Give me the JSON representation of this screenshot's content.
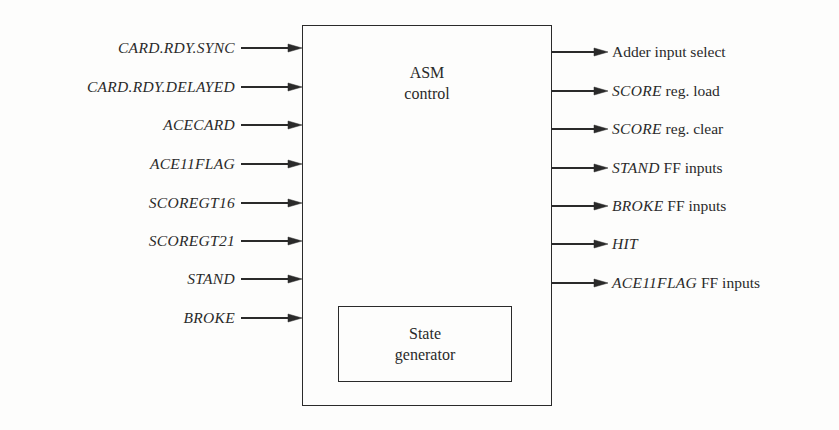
{
  "diagram": {
    "main_block": {
      "line1": "ASM",
      "line2": "control"
    },
    "inner_block": {
      "line1": "State",
      "line2": "generator"
    },
    "inputs": [
      {
        "label": "CARD.RDY.SYNC",
        "y": 48
      },
      {
        "label": "CARD.RDY.DELAYED",
        "y": 87
      },
      {
        "label": "ACECARD",
        "y": 125
      },
      {
        "label": "ACE11FLAG",
        "y": 164
      },
      {
        "label": "SCOREGT16",
        "y": 203
      },
      {
        "label": "SCOREGT21",
        "y": 241
      },
      {
        "label": "STAND",
        "y": 279
      },
      {
        "label": "BROKE",
        "y": 318
      }
    ],
    "outputs": [
      {
        "italic": "",
        "plain": "Adder input select",
        "y": 52
      },
      {
        "italic": "SCORE",
        "plain": " reg. load",
        "y": 91
      },
      {
        "italic": "SCORE",
        "plain": " reg. clear",
        "y": 129
      },
      {
        "italic": "STAND",
        "plain": " FF inputs",
        "y": 168
      },
      {
        "italic": "BROKE",
        "plain": " FF inputs",
        "y": 206
      },
      {
        "italic": "HIT",
        "plain": "",
        "y": 244
      },
      {
        "italic": "ACE11FLAG",
        "plain": " FF inputs",
        "y": 283
      }
    ]
  }
}
